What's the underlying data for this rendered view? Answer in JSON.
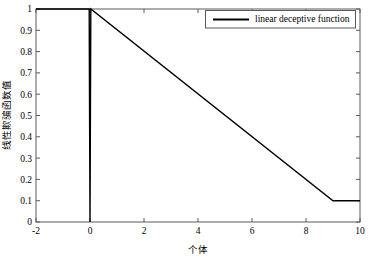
{
  "chart_data": {
    "type": "line",
    "title": "",
    "xlabel": "个体",
    "ylabel": "线性欺骗函数值",
    "xlim": [
      -2,
      10
    ],
    "ylim": [
      0,
      1
    ],
    "xticks": [
      -2,
      0,
      2,
      4,
      6,
      8,
      10
    ],
    "xtick_labels": [
      "-2",
      "0",
      "2",
      "4",
      "6",
      "8",
      "10"
    ],
    "yticks": [
      0,
      0.1,
      0.2,
      0.3,
      0.4,
      0.5,
      0.6,
      0.7,
      0.8,
      0.9,
      1
    ],
    "ytick_labels": [
      "0",
      "0.1",
      "0.2",
      "0.3",
      "0.4",
      "0.5",
      "0.6",
      "0.7",
      "0.8",
      "0.9",
      "1"
    ],
    "grid": false,
    "legend_position": "top-right",
    "series": [
      {
        "name": "linear deceptive function",
        "color": "#000000",
        "x": [
          -2,
          -0.03,
          0,
          0.03,
          9,
          10
        ],
        "y": [
          1,
          1,
          0,
          1,
          0.1,
          0.1
        ]
      }
    ],
    "annotations": [
      "sharp downward spike to 0 at x = 0",
      "linear decline from (0, 1) to (9, 0.1)",
      "flat plateau at y = 0.1 from x = 9 to x = 10"
    ]
  },
  "legend": {
    "entries": [
      {
        "label": "linear deceptive function",
        "color": "#000000"
      }
    ]
  },
  "axes": {
    "x_label": "个体",
    "y_label": "线性欺骗函数值"
  },
  "colors": {
    "line": "#000000",
    "axis": "#4d4d4d",
    "background": "#ffffff",
    "text": "#000000"
  }
}
